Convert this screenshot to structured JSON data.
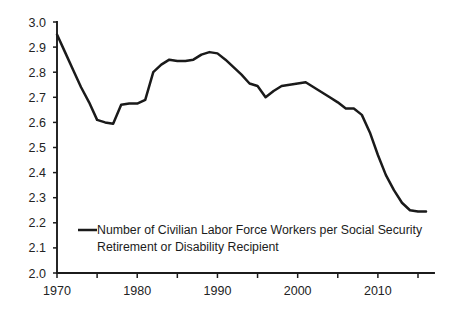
{
  "chart_data": {
    "type": "line",
    "title": "",
    "subtitle": "",
    "xlabel": "",
    "ylabel": "",
    "xlim": [
      1970,
      2016
    ],
    "ylim": [
      2.0,
      3.0
    ],
    "grid": false,
    "legend_position": "inside-bottom-left",
    "y_ticks": [
      "3.0",
      "2.9",
      "2.8",
      "2.7",
      "2.6",
      "2.5",
      "2.4",
      "2.3",
      "2.2",
      "2.1",
      "2.0"
    ],
    "y_tick_values": [
      3.0,
      2.9,
      2.8,
      2.7,
      2.6,
      2.5,
      2.4,
      2.3,
      2.2,
      2.1,
      2.0
    ],
    "x_ticks_labeled": [
      "1970",
      "1980",
      "1990",
      "2000",
      "2010"
    ],
    "x_tick_label_values": [
      1970,
      1980,
      1990,
      2000,
      2010
    ],
    "x_tick_values": [
      1970,
      1975,
      1980,
      1985,
      1990,
      1995,
      2000,
      2005,
      2010,
      2015
    ],
    "series": [
      {
        "name": "Number of Civilian Labor Force Workers per Social Security Retirement or Disability Recipient",
        "color": "#1a1a1a",
        "x": [
          1970,
          1971,
          1972,
          1973,
          1974,
          1975,
          1976,
          1977,
          1978,
          1979,
          1980,
          1981,
          1982,
          1983,
          1984,
          1985,
          1986,
          1987,
          1988,
          1989,
          1990,
          1991,
          1992,
          1993,
          1994,
          1995,
          1996,
          1997,
          1998,
          1999,
          2000,
          2001,
          2002,
          2003,
          2004,
          2005,
          2006,
          2007,
          2008,
          2009,
          2010,
          2011,
          2012,
          2013,
          2014,
          2015,
          2016
        ],
        "values": [
          2.95,
          2.88,
          2.81,
          2.74,
          2.68,
          2.61,
          2.6,
          2.595,
          2.67,
          2.675,
          2.675,
          2.69,
          2.8,
          2.83,
          2.85,
          2.845,
          2.845,
          2.85,
          2.87,
          2.88,
          2.875,
          2.85,
          2.82,
          2.79,
          2.755,
          2.745,
          2.7,
          2.725,
          2.745,
          2.75,
          2.755,
          2.76,
          2.74,
          2.72,
          2.7,
          2.68,
          2.655,
          2.655,
          2.63,
          2.56,
          2.47,
          2.39,
          2.33,
          2.28,
          2.25,
          2.245,
          2.245
        ]
      }
    ],
    "legend": [
      {
        "label_line_1": "Number of Civilian Labor Force Workers per Social Security",
        "label_line_2": "Retirement or Disability Recipient",
        "color": "#1a1a1a"
      }
    ]
  },
  "legend": {
    "line_1": "Number of Civilian Labor Force Workers per Social Security",
    "line_2": "Retirement or Disability Recipient"
  },
  "axis": {
    "y_labels": [
      "3.0",
      "2.9",
      "2.8",
      "2.7",
      "2.6",
      "2.5",
      "2.4",
      "2.3",
      "2.2",
      "2.1",
      "2.0"
    ],
    "x_labels": [
      "1970",
      "1980",
      "1990",
      "2000",
      "2010"
    ]
  }
}
